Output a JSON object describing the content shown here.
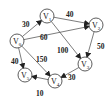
{
  "diagram": {
    "type": "directed-weighted-graph",
    "nodes": [
      {
        "id": "V0",
        "label": "V",
        "sub": "0",
        "x": 17,
        "y": 41
      },
      {
        "id": "V1",
        "label": "V",
        "sub": "1",
        "x": 47,
        "y": 16
      },
      {
        "id": "V2",
        "label": "V",
        "sub": "2",
        "x": 96,
        "y": 25
      },
      {
        "id": "V3",
        "label": "V",
        "sub": "3",
        "x": 85,
        "y": 64
      },
      {
        "id": "V4",
        "label": "V",
        "sub": "4",
        "x": 55,
        "y": 81
      },
      {
        "id": "V5",
        "label": "V",
        "sub": "5",
        "x": 25,
        "y": 75
      }
    ],
    "edges": [
      {
        "from": "V0",
        "to": "V1",
        "weight": "30",
        "lx": 22,
        "ly": 27
      },
      {
        "from": "V0",
        "to": "V2",
        "weight": "60",
        "lx": 40,
        "ly": 40
      },
      {
        "from": "V1",
        "to": "V2",
        "weight": "40",
        "lx": 66,
        "ly": 17
      },
      {
        "from": "V1",
        "to": "V3",
        "weight": "100",
        "lx": 57,
        "ly": 53
      },
      {
        "from": "V2",
        "to": "V3",
        "weight": "50",
        "lx": 97,
        "ly": 49
      },
      {
        "from": "V0",
        "to": "V4",
        "weight": "150",
        "lx": 36,
        "ly": 62
      },
      {
        "from": "V0",
        "to": "V5",
        "weight": "40",
        "lx": 11,
        "ly": 64
      },
      {
        "from": "V3",
        "to": "V4",
        "weight": "30",
        "lx": 68,
        "ly": 80
      },
      {
        "from": "V4",
        "to": "V5",
        "weight": "10",
        "lx": 36,
        "ly": 96
      }
    ]
  }
}
